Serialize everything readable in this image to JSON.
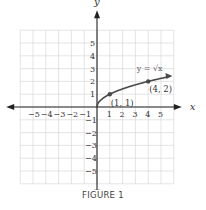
{
  "caption": "FIGURE 1",
  "chart_data": {
    "type": "line",
    "title": "",
    "xlabel": "x",
    "ylabel": "y",
    "xlim": [
      -6,
      6
    ],
    "ylim": [
      -6,
      6
    ],
    "grid": true,
    "x_ticks": [
      -5,
      -4,
      -3,
      -2,
      -1,
      1,
      2,
      3,
      4,
      5
    ],
    "y_ticks": [
      -5,
      -4,
      -3,
      -2,
      -1,
      1,
      2,
      3,
      4,
      5
    ],
    "x_tick_labels": [
      "−5",
      "−4",
      "−3",
      "−2",
      "−1",
      "1",
      "2",
      "3",
      "4",
      "5"
    ],
    "y_tick_labels": [
      "−5",
      "−4",
      "−3",
      "−2",
      "−1",
      "1",
      "2",
      "3",
      "4",
      "5"
    ],
    "series": [
      {
        "name": "y = √x",
        "function": "sqrt(x)",
        "x": [
          0,
          0.25,
          0.5,
          1,
          1.5,
          2,
          2.5,
          3,
          3.5,
          4,
          4.5,
          5,
          5.5
        ],
        "values": [
          0,
          0.5,
          0.707,
          1,
          1.225,
          1.414,
          1.581,
          1.732,
          1.871,
          2,
          2.121,
          2.236,
          2.345
        ],
        "color": "#4a4a4a",
        "arrow_end": true
      }
    ],
    "points": [
      {
        "x": 1,
        "y": 1,
        "label": "(1, 1)"
      },
      {
        "x": 4,
        "y": 2,
        "label": "(4, 2)"
      }
    ],
    "annotations": [
      {
        "text": "y = √x",
        "x": 3.1,
        "y": 2.8
      }
    ]
  },
  "colors": {
    "grid": "#d9d9d9",
    "axis": "#222222",
    "curve": "#4a4a4a",
    "text": "#333333"
  }
}
